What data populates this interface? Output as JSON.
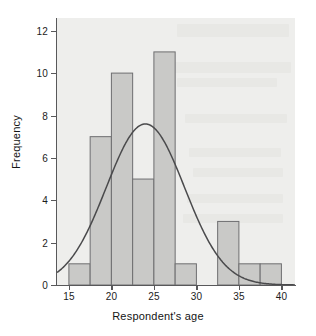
{
  "chart_data": {
    "type": "bar",
    "title": "",
    "subtitle": "",
    "xlabel": "Respondent's age",
    "ylabel": "Frequency",
    "xlim": [
      13.6,
      41.6
    ],
    "ylim": [
      0,
      12.6
    ],
    "grid": false,
    "legend": null,
    "bin_width": 2.5,
    "bin_starts": [
      15,
      17.5,
      20,
      22.5,
      25,
      27.5,
      30,
      32.5,
      35,
      37.5
    ],
    "categories": [
      "15-17.5",
      "17.5-20",
      "20-22.5",
      "22.5-25",
      "25-27.5",
      "27.5-30",
      "30-32.5",
      "32.5-35",
      "35-37.5",
      "37.5-40"
    ],
    "values": [
      1,
      7,
      10,
      5,
      11,
      1,
      0,
      3,
      1,
      1
    ],
    "xticks": [
      15,
      20,
      25,
      30,
      35,
      40
    ],
    "xticklabels": [
      "15",
      "20",
      "25",
      "30",
      "35",
      "40"
    ],
    "yticks": [
      0,
      2,
      4,
      6,
      8,
      10,
      12
    ],
    "yticklabels": [
      "0",
      "2",
      "4",
      "6",
      "8",
      "10",
      "12"
    ],
    "overlay": {
      "type": "line",
      "name": "normal curve",
      "peak_x": 24,
      "peak_y": 7.6,
      "mean": 24,
      "std_dev": 4.6,
      "amplitude": 7.6
    },
    "colors": {
      "bar_fill": "#c9c9c7",
      "bar_edge": "#6e6e70",
      "curve": "#4a4a4c",
      "axis": "#58585a",
      "plot_background": "#eeeeec",
      "figure_background": "#ffffff",
      "text": "#1c1c1c"
    }
  }
}
